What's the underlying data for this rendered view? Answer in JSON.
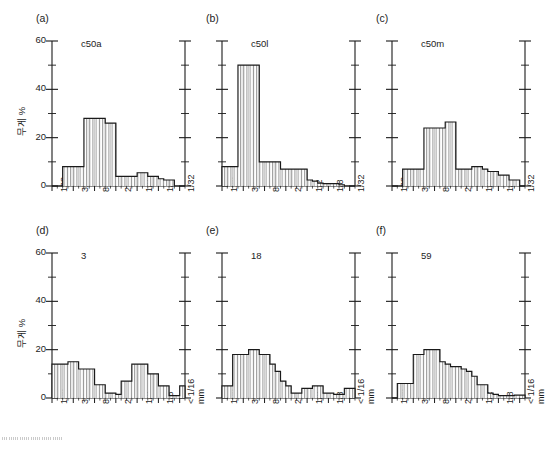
{
  "figure": {
    "ylabel_top": "무게 %",
    "ylabel_bottom": "무게 %",
    "unit_label": "mm",
    "yticks": [
      "0",
      "20",
      "40",
      "60"
    ],
    "xticks_top": [
      "128",
      "32",
      "8",
      "2",
      "1/2",
      "1/8",
      "1/32"
    ],
    "xticks_bottom": [
      "128",
      "32",
      "8",
      "2",
      "1/2",
      "1/8",
      "< 1/16"
    ],
    "line_color": "#1a1a1a",
    "hatch_color": "#555555",
    "background": "#ffffff"
  },
  "chart_data": [
    {
      "type": "bar",
      "panel": "(a)",
      "title": "c50a",
      "xlabel": "",
      "ylabel": "무게 %",
      "ylim": [
        0,
        60
      ],
      "categories": [
        "128",
        "90",
        "64",
        "45",
        "32",
        "22",
        "16",
        "11",
        "8",
        "5.6",
        "4",
        "2.8",
        "2",
        "1.4",
        "1",
        "0.71",
        "0.5",
        "0.35",
        "0.25",
        "0.18",
        "0.125",
        "0.09",
        "0.063",
        "0.045",
        "0.032"
      ],
      "tick_labels": [
        "128",
        "32",
        "8",
        "2",
        "1/2",
        "1/8",
        "1/32"
      ],
      "values": [
        0,
        0,
        8,
        8,
        8,
        8,
        28,
        28,
        28,
        28,
        26,
        26,
        4,
        4,
        4,
        4,
        5.5,
        5.5,
        4,
        4,
        3,
        2.5,
        2.5,
        0,
        0
      ]
    },
    {
      "type": "bar",
      "panel": "(b)",
      "title": "c50l",
      "xlabel": "",
      "ylabel": "",
      "ylim": [
        0,
        60
      ],
      "categories": [
        "128",
        "90",
        "64",
        "45",
        "32",
        "22",
        "16",
        "11",
        "8",
        "5.6",
        "4",
        "2.8",
        "2",
        "1.4",
        "1",
        "0.71",
        "0.5",
        "0.35",
        "0.25",
        "0.18",
        "0.125",
        "0.09",
        "0.063",
        "0.045",
        "0.032"
      ],
      "tick_labels": [
        "128",
        "32",
        "8",
        "2",
        "1/2",
        "1/8",
        "1/32"
      ],
      "values": [
        8,
        8,
        8,
        50,
        50,
        50,
        50,
        10,
        10,
        10,
        10,
        7,
        7,
        7,
        7,
        7,
        2.5,
        2,
        1.2,
        1,
        1,
        1,
        0.5,
        0,
        0
      ]
    },
    {
      "type": "bar",
      "panel": "(c)",
      "title": "c50m",
      "xlabel": "",
      "ylabel": "",
      "ylim": [
        0,
        60
      ],
      "categories": [
        "128",
        "90",
        "64",
        "45",
        "32",
        "22",
        "16",
        "11",
        "8",
        "5.6",
        "4",
        "2.8",
        "2",
        "1.4",
        "1",
        "0.71",
        "0.5",
        "0.35",
        "0.25",
        "0.18",
        "0.125",
        "0.09",
        "0.063",
        "0.045",
        "0.032"
      ],
      "tick_labels": [
        "128",
        "32",
        "8",
        "2",
        "1/2",
        "1/8",
        "1/32"
      ],
      "values": [
        0,
        0,
        7,
        7,
        7,
        7,
        24,
        24,
        24,
        24,
        26.5,
        26.5,
        7,
        7,
        7,
        8,
        8,
        7,
        6,
        6,
        4.5,
        4.5,
        2.5,
        2.5,
        0
      ]
    },
    {
      "type": "bar",
      "panel": "(d)",
      "title": "3",
      "xlabel": "mm",
      "ylabel": "무게 %",
      "ylim": [
        0,
        60
      ],
      "categories": [
        "128",
        "90",
        "64",
        "45",
        "32",
        "22",
        "16",
        "11",
        "8",
        "5.6",
        "4",
        "2.8",
        "2",
        "1.4",
        "1",
        "0.71",
        "0.5",
        "0.35",
        "0.25",
        "0.18",
        "0.125",
        "0.09",
        "0.063",
        "0.045",
        "0.032"
      ],
      "tick_labels": [
        "128",
        "32",
        "8",
        "2",
        "1/2",
        "1/8",
        "< 1/16"
      ],
      "values": [
        14,
        14,
        14,
        15,
        15,
        12,
        12,
        12,
        5.5,
        5.5,
        2,
        2,
        1.5,
        7,
        7,
        14,
        14,
        14,
        10,
        10,
        5,
        5,
        1,
        1,
        5
      ],
      "annotations": [
        "bimodal distribution"
      ]
    },
    {
      "type": "bar",
      "panel": "(e)",
      "title": "18",
      "xlabel": "mm",
      "ylabel": "",
      "ylim": [
        0,
        60
      ],
      "categories": [
        "128",
        "90",
        "64",
        "45",
        "32",
        "22",
        "16",
        "11",
        "8",
        "5.6",
        "4",
        "2.8",
        "2",
        "1.4",
        "1",
        "0.71",
        "0.5",
        "0.35",
        "0.25",
        "0.18",
        "0.125",
        "0.09",
        "0.063",
        "0.045",
        "0.032"
      ],
      "tick_labels": [
        "128",
        "32",
        "8",
        "2",
        "1/2",
        "1/8",
        "< 1/16"
      ],
      "values": [
        5,
        5,
        18,
        18,
        18,
        20,
        20,
        18,
        18,
        14,
        11,
        7,
        5,
        2,
        2,
        4,
        4,
        5,
        5,
        2,
        2,
        1.5,
        1.5,
        4,
        4
      ]
    },
    {
      "type": "bar",
      "panel": "(f)",
      "title": "59",
      "xlabel": "mm",
      "ylabel": "",
      "ylim": [
        0,
        60
      ],
      "categories": [
        "128",
        "90",
        "64",
        "45",
        "32",
        "22",
        "16",
        "11",
        "8",
        "5.6",
        "4",
        "2.8",
        "2",
        "1.4",
        "1",
        "0.71",
        "0.5",
        "0.35",
        "0.25",
        "0.18",
        "0.125",
        "0.09",
        "0.063",
        "0.045",
        "0.032"
      ],
      "tick_labels": [
        "128",
        "32",
        "8",
        "2",
        "1/2",
        "1/8",
        "< 1/16"
      ],
      "values": [
        0,
        6,
        6,
        6,
        18,
        18,
        20,
        20,
        20,
        15,
        14,
        13,
        13,
        12,
        11,
        9,
        5.5,
        5.5,
        2,
        1.5,
        1,
        1,
        1,
        1.2,
        1.2
      ]
    }
  ]
}
